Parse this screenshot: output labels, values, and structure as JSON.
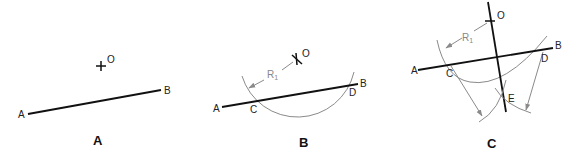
{
  "figure": {
    "panels": [
      {
        "id": "A",
        "caption": "A",
        "points": {
          "A": "A",
          "B": "B",
          "O": "O"
        }
      },
      {
        "id": "B",
        "caption": "B",
        "points": {
          "A": "A",
          "B": "B",
          "C": "C",
          "D": "D",
          "O": "O"
        },
        "radius_label": "R",
        "radius_sub": "1"
      },
      {
        "id": "C",
        "caption": "C",
        "points": {
          "A": "A",
          "B": "B",
          "C": "C",
          "D": "D",
          "E": "E",
          "O": "O"
        },
        "radius_label": "R",
        "radius_sub": "1"
      }
    ]
  }
}
